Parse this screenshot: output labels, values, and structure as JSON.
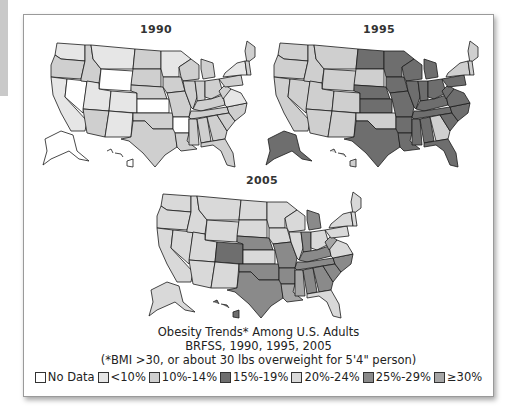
{
  "caption": {
    "line1": "Obesity Trends* Among U.S. Adults",
    "line2": "BRFSS, 1990, 1995, 2005",
    "line3": "(*BMI >30, or about 30 lbs overweight for 5'4\" person)"
  },
  "legend": [
    {
      "label": "No Data",
      "color": "#ffffff"
    },
    {
      "label": "<10%",
      "color": "#e6e6e6"
    },
    {
      "label": "10%-14%",
      "color": "#cfcfcf"
    },
    {
      "label": "15%-19%",
      "color": "#6e6e6e"
    },
    {
      "label": "20%-24%",
      "color": "#d9d9d9"
    },
    {
      "label": "25%-29%",
      "color": "#8a8a8a"
    },
    {
      "label": "≥30%",
      "color": "#a6a6a6"
    }
  ],
  "maps": [
    {
      "title": "1990"
    },
    {
      "title": "1995"
    },
    {
      "title": "2005"
    }
  ],
  "chart_data": {
    "type": "choropleth",
    "title": "Obesity Trends* Among U.S. Adults",
    "subtitle": "BRFSS, 1990, 1995, 2005",
    "footnote": "(*BMI >30, or about 30 lbs overweight for 5'4\" person)",
    "legend_position": "bottom",
    "categories": [
      "No Data",
      "<10%",
      "10%-14%",
      "15%-19%",
      "20%-24%",
      "25%-29%",
      "≥30%"
    ],
    "panels": [
      {
        "year": "1990",
        "summary": "Most states <10% or 10%-14%; several states No Data (NV, WY, KS, AR)",
        "states": {
          "WA": "<10%",
          "OR": "10%-14%",
          "CA": "<10%",
          "NV": "No Data",
          "ID": "10%-14%",
          "MT": "<10%",
          "WY": "No Data",
          "UT": "<10%",
          "CO": "<10%",
          "AZ": "10%-14%",
          "NM": "<10%",
          "ND": "10%-14%",
          "SD": "10%-14%",
          "NE": "10%-14%",
          "KS": "No Data",
          "OK": "10%-14%",
          "TX": "10%-14%",
          "MN": "<10%",
          "IA": "10%-14%",
          "MO": "10%-14%",
          "AR": "No Data",
          "LA": "10%-14%",
          "WI": "10%-14%",
          "IL": "10%-14%",
          "MI": "10%-14%",
          "IN": "10%-14%",
          "OH": "10%-14%",
          "KY": "10%-14%",
          "TN": "10%-14%",
          "MS": "10%-14%",
          "AL": "10%-14%",
          "GA": "10%-14%",
          "FL": "10%-14%",
          "SC": "10%-14%",
          "NC": "10%-14%",
          "VA": "<10%",
          "WV": "10%-14%",
          "PA": "10%-14%",
          "NY": "<10%",
          "ME": "10%-14%",
          "AK": "No Data",
          "HI": "No Data"
        }
      },
      {
        "year": "1995",
        "summary": "West and Northeast 10%-14%; Midwest, South and AK 15%-19%",
        "states": {
          "WA": "10%-14%",
          "OR": "10%-14%",
          "CA": "10%-14%",
          "NV": "10%-14%",
          "ID": "10%-14%",
          "MT": "10%-14%",
          "WY": "10%-14%",
          "UT": "10%-14%",
          "CO": "10%-14%",
          "AZ": "10%-14%",
          "NM": "10%-14%",
          "ND": "15%-19%",
          "SD": "10%-14%",
          "NE": "15%-19%",
          "KS": "15%-19%",
          "OK": "10%-14%",
          "TX": "15%-19%",
          "MN": "15%-19%",
          "IA": "15%-19%",
          "MO": "15%-19%",
          "AR": "15%-19%",
          "LA": "15%-19%",
          "WI": "15%-19%",
          "IL": "15%-19%",
          "MI": "15%-19%",
          "IN": "15%-19%",
          "OH": "15%-19%",
          "KY": "15%-19%",
          "TN": "15%-19%",
          "MS": "15%-19%",
          "AL": "15%-19%",
          "GA": "10%-14%",
          "FL": "15%-19%",
          "SC": "15%-19%",
          "NC": "15%-19%",
          "VA": "15%-19%",
          "WV": "15%-19%",
          "PA": "15%-19%",
          "NY": "10%-14%",
          "ME": "10%-14%",
          "AK": "15%-19%",
          "HI": "10%-14%"
        }
      },
      {
        "year": "2005",
        "summary": "Mostly 20%-24% in North/West; 25%-29% in South and Plains; ≥30% in MS, LA, WV",
        "states": {
          "WA": "20%-24%",
          "OR": "20%-24%",
          "CA": "20%-24%",
          "NV": "20%-24%",
          "ID": "20%-24%",
          "MT": "20%-24%",
          "WY": "20%-24%",
          "UT": "20%-24%",
          "CO": "15%-19%",
          "AZ": "20%-24%",
          "NM": "20%-24%",
          "ND": "20%-24%",
          "SD": "20%-24%",
          "NE": "25%-29%",
          "KS": "20%-24%",
          "OK": "25%-29%",
          "TX": "25%-29%",
          "MN": "20%-24%",
          "IA": "20%-24%",
          "MO": "25%-29%",
          "AR": "25%-29%",
          "LA": "≥30%",
          "WI": "20%-24%",
          "IL": "20%-24%",
          "MI": "25%-29%",
          "IN": "25%-29%",
          "OH": "20%-24%",
          "KY": "25%-29%",
          "TN": "25%-29%",
          "MS": "≥30%",
          "AL": "25%-29%",
          "GA": "25%-29%",
          "FL": "20%-24%",
          "SC": "25%-29%",
          "NC": "25%-29%",
          "VA": "20%-24%",
          "WV": "≥30%",
          "PA": "20%-24%",
          "NY": "20%-24%",
          "ME": "20%-24%",
          "AK": "20%-24%",
          "HI": "15%-19%"
        }
      }
    ]
  }
}
